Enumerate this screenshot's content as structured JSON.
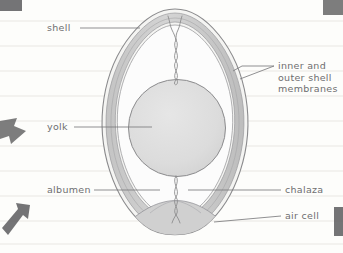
{
  "diagram": {
    "medium": "pencil sketch on ruled notebook paper",
    "labels": [
      {
        "id": "shell",
        "text": "shell",
        "side": "left",
        "x": 47,
        "y": 25
      },
      {
        "id": "yolk",
        "text": "yolk",
        "side": "left",
        "x": 47,
        "y": 122
      },
      {
        "id": "albumen",
        "text": "albumen",
        "side": "left",
        "x": 47,
        "y": 187
      },
      {
        "id": "membranes",
        "text": "inner and outer shell membranes",
        "side": "right",
        "x": 276,
        "y": 60
      },
      {
        "id": "chalaza",
        "text": "chalaza",
        "side": "right",
        "x": 284,
        "y": 187
      },
      {
        "id": "air-cell",
        "text": "air cell",
        "side": "right",
        "x": 284,
        "y": 212
      }
    ],
    "membranes_lines": [
      "inner and",
      "outer shell",
      "membranes"
    ],
    "parts": [
      "shell",
      "inner and outer shell membranes",
      "albumen",
      "yolk",
      "chalaza",
      "air cell"
    ]
  },
  "colors": {
    "paper": "#fdfdfb",
    "rule_line": "#e8e6e2",
    "ink": "#6e6e70",
    "shell_outline": "#8a8a8c",
    "membrane_fill": "#c9c9c9",
    "albumen_fill": "#fcfcfc",
    "yolk_fill": "#dcdcdc",
    "yolk_outline": "#8e8e90",
    "air_cell_fill": "#cfcfcf",
    "edge_mark": "#58585a"
  },
  "paper": {
    "rule_spacing_px": 25,
    "rule_count": 10
  },
  "edge_marks": [
    {
      "id": "corner-mark-top-left",
      "x": 0,
      "y": 0,
      "w": 22,
      "h": 12,
      "kind": "block"
    },
    {
      "id": "corner-mark-top-right",
      "x": 322,
      "y": 0,
      "w": 21,
      "h": 16,
      "kind": "block"
    },
    {
      "id": "arrow-left-middle",
      "x": 0,
      "y": 118,
      "w": 26,
      "h": 28,
      "kind": "arrow-right"
    },
    {
      "id": "arrow-left-bottom",
      "x": 0,
      "y": 203,
      "w": 30,
      "h": 32,
      "kind": "arrow-up-right"
    },
    {
      "id": "corner-mark-right-bottom",
      "x": 332,
      "y": 206,
      "w": 11,
      "h": 30,
      "kind": "block"
    }
  ]
}
